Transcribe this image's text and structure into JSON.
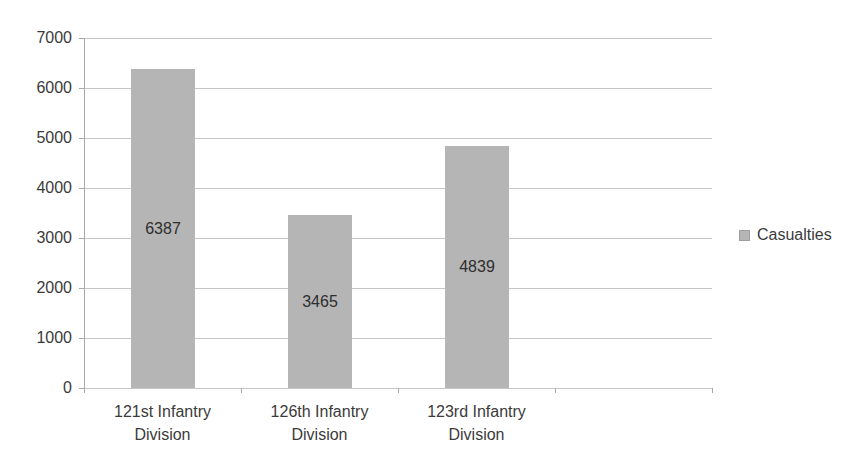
{
  "chart_data": {
    "type": "bar",
    "title": "",
    "categories": [
      "121st Infantry Division",
      "126th Infantry Division",
      "123rd Infantry Division"
    ],
    "series": [
      {
        "name": "Casualties",
        "values": [
          6387,
          3465,
          4839
        ]
      }
    ],
    "data_labels": [
      "6387",
      "3465",
      "4839"
    ],
    "ylim": [
      0,
      7000
    ],
    "ytick_step": 1000,
    "ytick_labels": [
      "0",
      "1000",
      "2000",
      "3000",
      "4000",
      "5000",
      "6000",
      "7000"
    ],
    "grid": "horizontal-on",
    "legend": {
      "label": "Casualties",
      "position": "right",
      "marker": "square"
    },
    "colors": {
      "bar_fill": "#b5b5b5",
      "bar_label_text": "#2e2e2e",
      "axis_text": "#3b3b3b",
      "gridline": "#c7c7c7",
      "axis_line": "#a8a8a8",
      "background": "#ffffff"
    }
  }
}
